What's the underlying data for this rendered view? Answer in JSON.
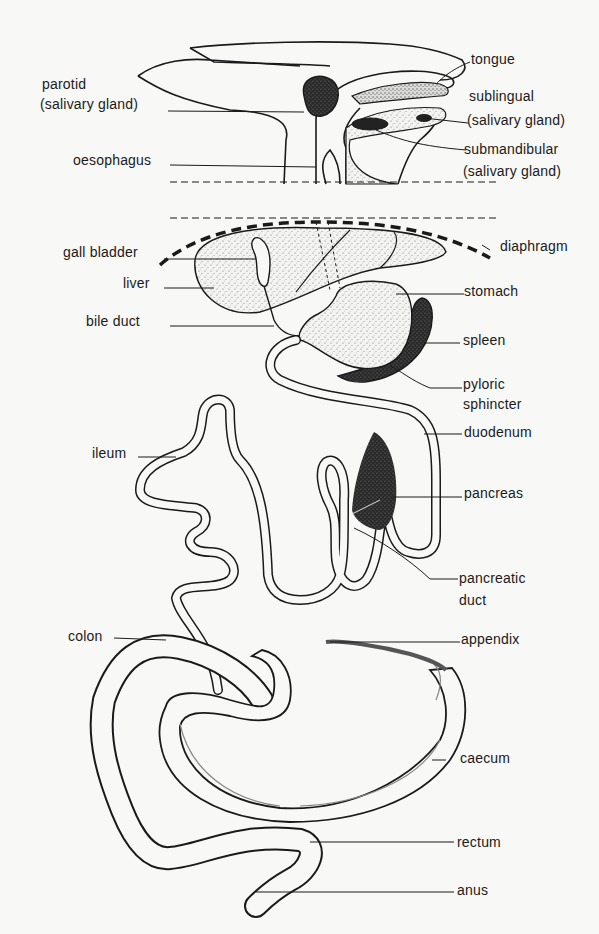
{
  "diagram": {
    "colors": {
      "ink": "#1a1a1a",
      "background": "#f8f8f6",
      "stipple": "#8a8a8a",
      "dark_organ": "#2a2a2a"
    },
    "labels": {
      "parotid": "parotid",
      "parotid_sub": "(salivary gland)",
      "tongue": "tongue",
      "sublingual": "sublingual",
      "sublingual_sub": "(salivary gland)",
      "oesophagus": "oesophagus",
      "submandibular": "submandibular",
      "submandibular_sub": "(salivary gland)",
      "gall_bladder": "gall bladder",
      "diaphragm": "diaphragm",
      "liver": "liver",
      "stomach": "stomach",
      "bile_duct": "bile duct",
      "spleen": "spleen",
      "pyloric": "pyloric",
      "pyloric_sub": "sphincter",
      "ileum": "ileum",
      "duodenum": "duodenum",
      "pancreas": "pancreas",
      "pancreatic": "pancreatic",
      "pancreatic_sub": "duct",
      "colon": "colon",
      "appendix": "appendix",
      "caecum": "caecum",
      "rectum": "rectum",
      "anus": "anus"
    }
  }
}
